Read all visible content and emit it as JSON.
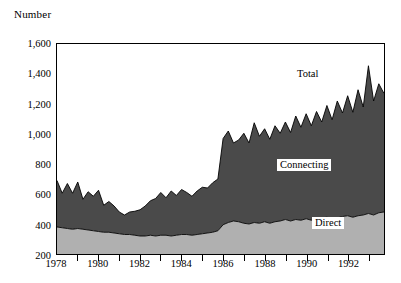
{
  "axis": {
    "y_title": "Number",
    "y_ticks": [
      "200",
      "400",
      "600",
      "800",
      "1,000",
      "1,200",
      "1,400",
      "1,600"
    ],
    "y_values": [
      200,
      400,
      600,
      800,
      1000,
      1200,
      1400,
      1600
    ],
    "x_ticks": [
      "1978",
      "1980",
      "1982",
      "1984",
      "1986",
      "1988",
      "1990",
      "1992"
    ],
    "x_values": [
      1978,
      1980,
      1982,
      1984,
      1986,
      1988,
      1990,
      1992
    ]
  },
  "labels": {
    "total": "Total",
    "connecting": "Connecting",
    "direct": "Direct"
  },
  "colors": {
    "connecting": "#4a4a4a",
    "direct": "#b0b0b0",
    "axis": "#000000",
    "background": "#ffffff"
  },
  "chart_data": {
    "type": "area",
    "title": "",
    "subtitle": "",
    "xlabel": "",
    "ylabel": "Number",
    "ylim": [
      200,
      1600
    ],
    "xlim": [
      1978,
      1993.75
    ],
    "grid": false,
    "stacked": true,
    "legend": "inline-annotations",
    "annotations": [
      {
        "text": "Total",
        "note": "labels upper boundary of stacked total"
      },
      {
        "text": "Connecting",
        "note": "labels dark upper band"
      },
      {
        "text": "Direct",
        "note": "labels light lower band"
      }
    ],
    "x": [
      1978.0,
      1978.25,
      1978.5,
      1978.75,
      1979.0,
      1979.25,
      1979.5,
      1979.75,
      1980.0,
      1980.25,
      1980.5,
      1980.75,
      1981.0,
      1981.25,
      1981.5,
      1981.75,
      1982.0,
      1982.25,
      1982.5,
      1982.75,
      1983.0,
      1983.25,
      1983.5,
      1983.75,
      1984.0,
      1984.25,
      1984.5,
      1984.75,
      1985.0,
      1985.25,
      1985.5,
      1985.75,
      1986.0,
      1986.25,
      1986.5,
      1986.75,
      1987.0,
      1987.25,
      1987.5,
      1987.75,
      1988.0,
      1988.25,
      1988.5,
      1988.75,
      1989.0,
      1989.25,
      1989.5,
      1989.75,
      1990.0,
      1990.25,
      1990.5,
      1990.75,
      1991.0,
      1991.25,
      1991.5,
      1991.75,
      1992.0,
      1992.25,
      1992.5,
      1992.75,
      1993.0,
      1993.25,
      1993.5,
      1993.75
    ],
    "series": [
      {
        "name": "Direct",
        "stack_order": 1,
        "values": [
          380,
          375,
          370,
          365,
          370,
          365,
          360,
          355,
          350,
          345,
          345,
          340,
          335,
          330,
          330,
          325,
          320,
          320,
          325,
          320,
          325,
          325,
          320,
          325,
          330,
          330,
          325,
          330,
          335,
          340,
          345,
          355,
          395,
          410,
          420,
          415,
          405,
          400,
          410,
          405,
          415,
          405,
          415,
          420,
          430,
          420,
          430,
          425,
          435,
          425,
          430,
          440,
          445,
          435,
          440,
          450,
          455,
          445,
          455,
          460,
          470,
          460,
          475,
          480
        ]
      },
      {
        "name": "Connecting",
        "stack_order": 2,
        "values": [
          310,
          230,
          300,
          240,
          310,
          200,
          255,
          230,
          275,
          180,
          205,
          180,
          145,
          130,
          150,
          160,
          175,
          200,
          230,
          250,
          285,
          250,
          300,
          265,
          300,
          280,
          260,
          290,
          310,
          300,
          330,
          345,
          575,
          610,
          520,
          545,
          600,
          540,
          665,
          580,
          620,
          560,
          640,
          585,
          650,
          590,
          690,
          620,
          700,
          630,
          720,
          640,
          745,
          660,
          780,
          690,
          800,
          700,
          840,
          720,
          985,
          760,
          860,
          790
        ]
      },
      {
        "name": "Total",
        "computed": true,
        "values": [
          690,
          605,
          670,
          605,
          680,
          565,
          615,
          585,
          625,
          525,
          550,
          520,
          480,
          460,
          480,
          485,
          495,
          520,
          555,
          570,
          610,
          575,
          620,
          590,
          630,
          610,
          585,
          620,
          645,
          640,
          675,
          700,
          970,
          1020,
          940,
          960,
          1005,
          940,
          1075,
          985,
          1035,
          965,
          1055,
          1005,
          1080,
          1010,
          1120,
          1045,
          1135,
          1055,
          1150,
          1080,
          1190,
          1095,
          1220,
          1140,
          1255,
          1145,
          1295,
          1180,
          1455,
          1220,
          1335,
          1270
        ]
      }
    ]
  }
}
